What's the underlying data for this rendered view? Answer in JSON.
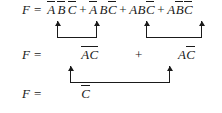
{
  "diagram": {
    "ink_color": "#1a1a1a",
    "background_color": "#ffffff",
    "rows": [
      {
        "id": "row-1",
        "lhs": "F",
        "equals": "=",
        "expression_text": "ĀB̄C̄ + ĀBC̄ + ABC̄ + AB̄C̄",
        "terms": [
          {
            "literals": [
              {
                "name": "A",
                "bar": true
              },
              {
                "name": "B",
                "bar": true
              },
              {
                "name": "C",
                "bar": true
              }
            ]
          },
          {
            "literals": [
              {
                "name": "A",
                "bar": true
              },
              {
                "name": "B",
                "bar": false
              },
              {
                "name": "C",
                "bar": true
              }
            ]
          },
          {
            "literals": [
              {
                "name": "A",
                "bar": false
              },
              {
                "name": "B",
                "bar": false
              },
              {
                "name": "C",
                "bar": true
              }
            ]
          },
          {
            "literals": [
              {
                "name": "A",
                "bar": false
              },
              {
                "name": "B",
                "bar": true
              },
              {
                "name": "C",
                "bar": true
              }
            ]
          }
        ],
        "operator": "+"
      },
      {
        "id": "row-2",
        "lhs": "F",
        "equals": "=",
        "expression_text": "ĀC̄ + AC̄",
        "terms": [
          {
            "literals": [
              {
                "name": "A",
                "bar": true
              },
              {
                "name": "C",
                "bar": true
              }
            ]
          },
          {
            "literals": [
              {
                "name": "A",
                "bar": false
              },
              {
                "name": "C",
                "bar": true
              }
            ]
          }
        ],
        "operator": "+"
      },
      {
        "id": "row-3",
        "lhs": "F",
        "equals": "=",
        "expression_text": "C̄",
        "terms": [
          {
            "literals": [
              {
                "name": "C",
                "bar": true
              }
            ]
          }
        ],
        "operator": ""
      }
    ],
    "brackets": [
      {
        "id": "bracket-1",
        "label": "group-term1-term2",
        "arrow_direction": "up",
        "shape": "u-bracket"
      },
      {
        "id": "bracket-2",
        "label": "group-term3-term4",
        "arrow_direction": "up",
        "shape": "u-bracket"
      },
      {
        "id": "bracket-3",
        "label": "group-row2-terms",
        "arrow_direction": "up",
        "shape": "u-bracket"
      }
    ]
  }
}
